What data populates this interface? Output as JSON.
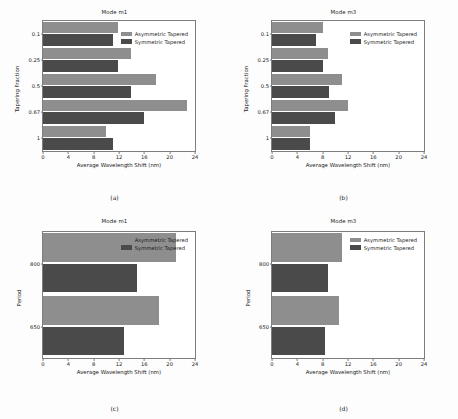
{
  "figure": {
    "series_colors": {
      "asymmetric": "#8e8e8e",
      "symmetric": "#4a4a4a"
    },
    "legend": {
      "asymmetric_label": "Asymmetric Tapered",
      "symmetric_label": "Symmetric Tapered"
    }
  },
  "chart_data": [
    {
      "id": "a",
      "type": "bar",
      "orientation": "horizontal",
      "title": "Mode m1",
      "caption": "(a)",
      "xlabel": "Average Wavelength Shift (nm)",
      "ylabel": "Tapering Fraction",
      "categories": [
        "0.1",
        "0.25",
        "0.5",
        "0.67",
        "1"
      ],
      "xticks": [
        0,
        4,
        8,
        12,
        16,
        20,
        24
      ],
      "xlim": [
        0,
        24
      ],
      "grid": false,
      "legend_position": "upper right",
      "series": [
        {
          "name": "Asymmetric Tapered",
          "values": [
            11.9,
            13.9,
            17.8,
            22.8,
            10.0
          ]
        },
        {
          "name": "Symmetric Tapered",
          "values": [
            11.1,
            11.9,
            13.9,
            16.0,
            11.1
          ]
        }
      ]
    },
    {
      "id": "b",
      "type": "bar",
      "orientation": "horizontal",
      "title": "Mode m3",
      "caption": "(b)",
      "xlabel": "Average Wavelength Shift (nm)",
      "ylabel": "Tapering Fraction",
      "categories": [
        "0.1",
        "0.25",
        "0.5",
        "0.67",
        "1"
      ],
      "xticks": [
        0,
        4,
        8,
        12,
        16,
        20,
        24
      ],
      "xlim": [
        0,
        24
      ],
      "grid": false,
      "legend_position": "upper right",
      "series": [
        {
          "name": "Asymmetric Tapered",
          "values": [
            8.0,
            8.9,
            11.0,
            12.0,
            6.0
          ]
        },
        {
          "name": "Symmetric Tapered",
          "values": [
            7.0,
            8.0,
            9.0,
            10.0,
            6.0
          ]
        }
      ]
    },
    {
      "id": "c",
      "type": "bar",
      "orientation": "horizontal",
      "title": "Mode m1",
      "caption": "(c)",
      "xlabel": "Average Wavelength Shift (nm)",
      "ylabel": "Period",
      "categories": [
        "800",
        "650"
      ],
      "xticks": [
        0,
        4,
        8,
        12,
        16,
        20,
        24
      ],
      "xlim": [
        0,
        24
      ],
      "grid": false,
      "legend_position": "upper right",
      "series": [
        {
          "name": "Asymmetric Tapered",
          "values": [
            21.0,
            18.3
          ]
        },
        {
          "name": "Symmetric Tapered",
          "values": [
            14.8,
            12.8
          ]
        }
      ]
    },
    {
      "id": "d",
      "type": "bar",
      "orientation": "horizontal",
      "title": "Mode m3",
      "caption": "(d)",
      "xlabel": "Average Wavelength Shift (nm)",
      "ylabel": "Period",
      "categories": [
        "800",
        "650"
      ],
      "xticks": [
        0,
        4,
        8,
        12,
        16,
        20,
        24
      ],
      "xlim": [
        0,
        24
      ],
      "grid": false,
      "legend_position": "upper right",
      "series": [
        {
          "name": "Asymmetric Tapered",
          "values": [
            11.0,
            10.6
          ]
        },
        {
          "name": "Symmetric Tapered",
          "values": [
            8.8,
            8.4
          ]
        }
      ]
    }
  ]
}
